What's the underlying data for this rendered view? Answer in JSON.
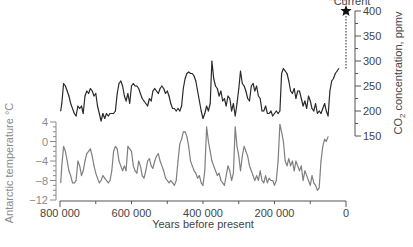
{
  "chart_data": [
    {
      "type": "line",
      "name": "co2",
      "ylabel": "CO2 concentration, ppmv",
      "ylabel_base": "CO",
      "ylabel_sub": "2",
      "ylabel_rest": " concentration, ppmv",
      "ylim": [
        150,
        400
      ],
      "yticks": [
        150,
        200,
        250,
        300,
        350,
        400
      ],
      "yaxis_side": "right",
      "color": "#2a2a2a",
      "current": {
        "label": "Current",
        "year": 0,
        "value": 400,
        "marker": "star-icon"
      },
      "x": [
        798000,
        795000,
        790000,
        785000,
        780000,
        775000,
        770000,
        765000,
        760000,
        755000,
        750000,
        745000,
        740000,
        735000,
        730000,
        725000,
        720000,
        715000,
        710000,
        705000,
        700000,
        695000,
        690000,
        685000,
        680000,
        675000,
        670000,
        665000,
        660000,
        655000,
        650000,
        645000,
        640000,
        635000,
        630000,
        625000,
        620000,
        615000,
        610000,
        605000,
        600000,
        595000,
        590000,
        585000,
        580000,
        575000,
        570000,
        565000,
        560000,
        555000,
        550000,
        545000,
        540000,
        535000,
        530000,
        525000,
        520000,
        515000,
        510000,
        505000,
        500000,
        495000,
        490000,
        485000,
        480000,
        475000,
        470000,
        465000,
        460000,
        455000,
        450000,
        445000,
        440000,
        435000,
        430000,
        425000,
        420000,
        415000,
        410000,
        405000,
        400000,
        395000,
        390000,
        385000,
        380000,
        375000,
        370000,
        365000,
        360000,
        355000,
        350000,
        345000,
        340000,
        335000,
        330000,
        325000,
        320000,
        315000,
        310000,
        305000,
        300000,
        295000,
        290000,
        285000,
        280000,
        275000,
        270000,
        265000,
        260000,
        255000,
        250000,
        245000,
        240000,
        235000,
        230000,
        225000,
        220000,
        215000,
        210000,
        205000,
        200000,
        195000,
        190000,
        185000,
        180000,
        175000,
        170000,
        165000,
        160000,
        155000,
        150000,
        145000,
        140000,
        135000,
        130000,
        125000,
        120000,
        115000,
        110000,
        105000,
        100000,
        95000,
        90000,
        85000,
        80000,
        75000,
        70000,
        65000,
        60000,
        55000,
        50000,
        45000,
        40000,
        35000,
        30000,
        25000,
        20000,
        15000,
        10000,
        5000,
        2000
      ],
      "values": [
        200,
        215,
        255,
        250,
        240,
        230,
        215,
        205,
        195,
        190,
        210,
        205,
        210,
        195,
        230,
        240,
        235,
        245,
        240,
        230,
        235,
        210,
        195,
        180,
        195,
        185,
        195,
        190,
        195,
        195,
        195,
        200,
        235,
        255,
        260,
        250,
        230,
        220,
        235,
        215,
        250,
        255,
        250,
        250,
        245,
        235,
        225,
        220,
        215,
        210,
        225,
        220,
        240,
        245,
        240,
        235,
        245,
        250,
        245,
        235,
        240,
        230,
        215,
        205,
        205,
        200,
        205,
        200,
        210,
        245,
        265,
        275,
        278,
        275,
        275,
        270,
        260,
        240,
        220,
        200,
        185,
        195,
        210,
        200,
        215,
        300,
        265,
        250,
        245,
        230,
        240,
        220,
        225,
        210,
        230,
        225,
        200,
        215,
        190,
        215,
        245,
        280,
        255,
        250,
        240,
        225,
        220,
        250,
        255,
        240,
        250,
        230,
        225,
        200,
        200,
        210,
        195,
        195,
        200,
        190,
        195,
        200,
        195,
        200,
        275,
        285,
        280,
        275,
        260,
        240,
        235,
        245,
        225,
        240,
        240,
        225,
        210,
        220,
        205,
        230,
        220,
        205,
        200,
        215,
        195,
        200,
        195,
        205,
        215,
        200,
        190,
        240,
        260,
        265,
        275,
        280,
        285
      ]
    },
    {
      "type": "line",
      "name": "temperature",
      "ylabel": "Antarctic temperature °C",
      "ylim": [
        -12,
        4
      ],
      "yticks": [
        -12,
        -8,
        -4,
        0,
        4
      ],
      "yaxis_side": "left",
      "color": "#7f7f7f",
      "x": [
        798000,
        795000,
        790000,
        785000,
        780000,
        775000,
        770000,
        765000,
        760000,
        755000,
        750000,
        745000,
        740000,
        735000,
        730000,
        725000,
        720000,
        715000,
        710000,
        705000,
        700000,
        695000,
        690000,
        685000,
        680000,
        675000,
        670000,
        665000,
        660000,
        655000,
        650000,
        645000,
        640000,
        635000,
        630000,
        625000,
        620000,
        615000,
        610000,
        605000,
        600000,
        595000,
        590000,
        585000,
        580000,
        575000,
        570000,
        565000,
        560000,
        555000,
        550000,
        545000,
        540000,
        535000,
        530000,
        525000,
        520000,
        515000,
        510000,
        505000,
        500000,
        495000,
        490000,
        485000,
        480000,
        475000,
        470000,
        465000,
        460000,
        455000,
        450000,
        445000,
        440000,
        435000,
        430000,
        425000,
        420000,
        415000,
        410000,
        405000,
        400000,
        395000,
        390000,
        385000,
        380000,
        375000,
        370000,
        365000,
        360000,
        355000,
        350000,
        345000,
        340000,
        335000,
        330000,
        325000,
        320000,
        315000,
        310000,
        305000,
        300000,
        295000,
        290000,
        285000,
        280000,
        275000,
        270000,
        265000,
        260000,
        255000,
        250000,
        245000,
        240000,
        235000,
        230000,
        225000,
        220000,
        215000,
        210000,
        205000,
        200000,
        195000,
        190000,
        185000,
        180000,
        175000,
        170000,
        165000,
        160000,
        155000,
        150000,
        145000,
        140000,
        135000,
        130000,
        125000,
        120000,
        115000,
        110000,
        105000,
        100000,
        95000,
        90000,
        85000,
        80000,
        75000,
        70000,
        65000,
        60000,
        55000,
        50000,
        45000,
        40000,
        35000,
        30000,
        25000,
        20000,
        15000,
        10000,
        5000,
        2000
      ],
      "values": [
        -8.5,
        -5,
        -1,
        -2,
        -4,
        -6,
        -7,
        -8.5,
        -8.5,
        -8,
        -4,
        -5,
        -7,
        -6,
        -4,
        -2.5,
        -2,
        -1.5,
        -3,
        -5,
        -6.5,
        -7.5,
        -8.5,
        -8,
        -7,
        -7.5,
        -8,
        -8.5,
        -8,
        -6,
        -2,
        -1,
        -1.5,
        -4,
        -5,
        -6,
        -5,
        -6,
        -1,
        -1.5,
        -2,
        -5,
        -6,
        -6.5,
        -4,
        -5,
        -7,
        -7.5,
        -6,
        -4,
        -3.5,
        -5,
        -5.5,
        -4,
        -3,
        -2.5,
        -4,
        -5,
        -6,
        -7.5,
        -8,
        -8.5,
        -8,
        -8.5,
        -9,
        -8,
        -4,
        -0.5,
        0.5,
        2,
        2,
        1,
        -1,
        -4,
        -5,
        -6,
        -6.5,
        -7.5,
        -7,
        -8.5,
        -9,
        -6,
        3,
        0,
        -2,
        -4,
        -5,
        -6,
        -7,
        -6.5,
        -8,
        -8.5,
        -9,
        -7,
        -5,
        -6,
        -8,
        -6.5,
        3,
        -1,
        -3,
        -6,
        -3,
        -1,
        -2,
        -3,
        -5,
        -6,
        -7,
        -8,
        -7,
        -8,
        -6,
        -8,
        -8.5,
        -7,
        -8.5,
        -7.5,
        -8,
        -8,
        -9,
        -8,
        -4,
        3.5,
        2,
        0,
        -4,
        -5,
        -3.5,
        -5,
        -4,
        -6,
        -4,
        -5,
        -6,
        -5,
        -8,
        -6,
        -7,
        -8,
        -9,
        -7,
        -8.5,
        -9,
        -10,
        -9.5,
        -4,
        -1,
        0.5,
        0,
        1
      ]
    }
  ],
  "xaxis": {
    "label": "Years before present",
    "xlim": [
      800000,
      0
    ],
    "ticks": [
      800000,
      700000,
      600000,
      500000,
      400000,
      300000,
      200000,
      100000,
      0
    ],
    "tick_labels": [
      "800 000",
      "600 000",
      "400 000",
      "200 000",
      "0"
    ],
    "labeled_ticks": [
      800000,
      600000,
      400000,
      200000,
      0
    ]
  }
}
